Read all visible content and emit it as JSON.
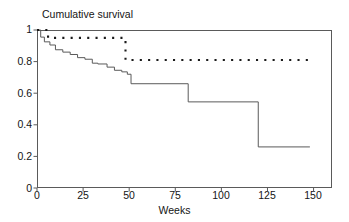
{
  "chart_data": {
    "type": "line",
    "title": "Cumulative survival",
    "xlabel": "Weeks",
    "ylabel": "",
    "xlim": [
      0,
      160
    ],
    "ylim": [
      0,
      1
    ],
    "xticks": [
      0,
      25,
      50,
      75,
      100,
      125,
      150
    ],
    "xtick_labels": [
      "0",
      "25",
      "50",
      "75",
      "100",
      "125",
      "150"
    ],
    "yticks": [
      0,
      0.2,
      0.4,
      0.6,
      0.8,
      1
    ],
    "ytick_labels": [
      "0",
      "0.2",
      "0.4",
      "0.6",
      "0.8",
      "1"
    ],
    "grid": false,
    "legend": "none",
    "plot_style": "kaplan-meier step function",
    "series": [
      {
        "name": "solid-curve",
        "style": "solid",
        "color": "#5a5a5a",
        "x": [
          0,
          2,
          2,
          4,
          4,
          7,
          7,
          10,
          10,
          14,
          14,
          18,
          18,
          22,
          22,
          26,
          26,
          30,
          30,
          33,
          33,
          38,
          38,
          42,
          42,
          46,
          46,
          49,
          49,
          51,
          51,
          82,
          82,
          120,
          120,
          148
        ],
        "y": [
          1.0,
          1.0,
          0.955,
          0.955,
          0.925,
          0.925,
          0.905,
          0.905,
          0.875,
          0.875,
          0.86,
          0.86,
          0.845,
          0.845,
          0.825,
          0.825,
          0.815,
          0.815,
          0.79,
          0.79,
          0.785,
          0.785,
          0.765,
          0.765,
          0.745,
          0.745,
          0.735,
          0.735,
          0.72,
          0.72,
          0.66,
          0.66,
          0.545,
          0.545,
          0.26,
          0.26
        ]
      },
      {
        "name": "dotted-curve",
        "style": "dotted",
        "color": "#1a1a1a",
        "x": [
          0,
          6,
          6,
          48,
          48,
          150
        ],
        "y": [
          1.0,
          1.0,
          0.95,
          0.95,
          0.81,
          0.81
        ]
      }
    ],
    "annotations": []
  },
  "figure": {
    "title": "Cumulative survival",
    "xaxis_label": "Weeks",
    "ytick_0": "0",
    "ytick_1": "0.2",
    "ytick_2": "0.4",
    "ytick_3": "0.6",
    "ytick_4": "0.8",
    "ytick_5": "1",
    "xtick_0": "0",
    "xtick_1": "25",
    "xtick_2": "50",
    "xtick_3": "75",
    "xtick_4": "100",
    "xtick_5": "125",
    "xtick_6": "150"
  },
  "colors": {
    "axis": "#5a5a5a",
    "solid_line": "#5a5a5a",
    "dotted_line": "#1a1a1a",
    "text": "#141414",
    "background": "#ffffff"
  }
}
